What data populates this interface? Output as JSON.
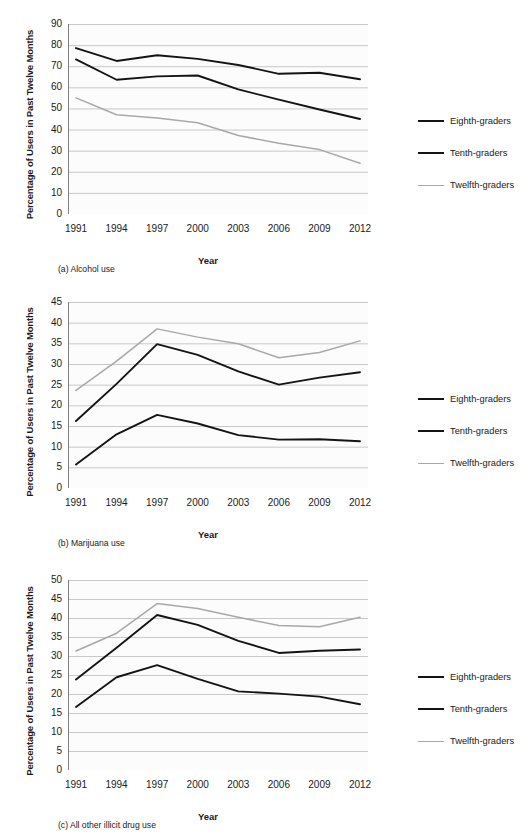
{
  "figure": {
    "series_names": [
      "Eighth-graders",
      "Tenth-graders",
      "Twelfth-graders"
    ],
    "axis_titles": {
      "y": "Percentage of Users in Past Twelve Months",
      "x": "Year"
    },
    "colors": {
      "eighth": "#141414",
      "tenth": "#141414",
      "twelfth": "#a8a8a8",
      "gridline": "#c8c8c8",
      "axis": "#7f7f7f",
      "text": "#1a1a1a",
      "background": "#ffffff"
    }
  },
  "panels": [
    {
      "id": "a",
      "caption": "(a) Alcohol use",
      "legend": [
        "Eighth-graders",
        "Tenth-graders",
        "Twelfth-graders"
      ],
      "yticks": [
        "0",
        "10",
        "20",
        "30",
        "40",
        "50",
        "60",
        "70",
        "80",
        "90"
      ],
      "xticks": [
        "1991",
        "1994",
        "1997",
        "2000",
        "2003",
        "2006",
        "2009",
        "2012"
      ]
    },
    {
      "id": "b",
      "caption": "(b) Marijuana use",
      "legend": [
        "Eighth-graders",
        "Tenth-graders",
        "Twelfth-graders"
      ],
      "yticks": [
        "0",
        "5",
        "10",
        "15",
        "20",
        "25",
        "30",
        "35",
        "40",
        "45"
      ],
      "xticks": [
        "1991",
        "1994",
        "1997",
        "2000",
        "2003",
        "2006",
        "2009",
        "2012"
      ]
    },
    {
      "id": "c",
      "caption": "(c) All other illicit drug use",
      "legend": [
        "Eighth-graders",
        "Tenth-graders",
        "Twelfth-graders"
      ],
      "yticks": [
        "0",
        "5",
        "10",
        "15",
        "20",
        "25",
        "30",
        "35",
        "40",
        "45",
        "50"
      ],
      "xticks": [
        "1991",
        "1994",
        "1997",
        "2000",
        "2003",
        "2006",
        "2009",
        "2012"
      ]
    }
  ],
  "chart_data": [
    {
      "type": "line",
      "title": "(a) Alcohol use",
      "xlabel": "Year",
      "ylabel": "Percentage of Users in Past Twelve Months",
      "categories": [
        1991,
        1994,
        1997,
        2000,
        2003,
        2006,
        2009,
        2012
      ],
      "ylim": [
        0,
        90
      ],
      "ytick_step": 10,
      "grid": true,
      "legend_position": "right",
      "series": [
        {
          "name": "Eighth-graders",
          "color": "#141414",
          "values": [
            73.2,
            63.6,
            65.2,
            65.6,
            59.0,
            54.2,
            49.5,
            45.0
          ]
        },
        {
          "name": "Tenth-graders",
          "color": "#141414",
          "values": [
            78.6,
            72.5,
            75.2,
            73.5,
            70.6,
            66.4,
            66.9,
            63.8
          ]
        },
        {
          "name": "Twelfth-graders",
          "color": "#a8a8a8",
          "values": [
            55.0,
            47.0,
            45.5,
            43.2,
            37.2,
            33.5,
            30.5,
            24.0
          ]
        }
      ],
      "series_note": "Eighth-graders plotted lowest of the two dark lines; values read from gridlines"
    },
    {
      "type": "line",
      "title": "(b) Marijuana use",
      "xlabel": "Year",
      "ylabel": "Percentage of Users in Past Twelve Months",
      "categories": [
        1991,
        1994,
        1997,
        2000,
        2003,
        2006,
        2009,
        2012
      ],
      "ylim": [
        0,
        45
      ],
      "ytick_step": 5,
      "grid": true,
      "legend_position": "right",
      "series": [
        {
          "name": "Eighth-graders",
          "color": "#141414",
          "values": [
            5.7,
            13.0,
            17.7,
            15.6,
            12.8,
            11.7,
            11.8,
            11.3
          ]
        },
        {
          "name": "Tenth-graders",
          "color": "#141414",
          "values": [
            16.2,
            25.2,
            34.8,
            32.2,
            28.2,
            25.0,
            26.7,
            28.0
          ]
        },
        {
          "name": "Twelfth-graders",
          "color": "#a8a8a8",
          "values": [
            23.6,
            30.7,
            38.5,
            36.5,
            34.9,
            31.5,
            32.8,
            35.6
          ]
        }
      ]
    },
    {
      "type": "line",
      "title": "(c) All other illicit drug use",
      "xlabel": "Year",
      "ylabel": "Percentage of Users in Past Twelve Months",
      "categories": [
        1991,
        1994,
        1997,
        2000,
        2003,
        2006,
        2009,
        2012
      ],
      "ylim": [
        0,
        50
      ],
      "ytick_step": 5,
      "grid": true,
      "legend_position": "right",
      "series": [
        {
          "name": "Eighth-graders",
          "color": "#141414",
          "values": [
            16.6,
            24.4,
            27.6,
            24.0,
            20.7,
            20.1,
            19.3,
            17.3
          ]
        },
        {
          "name": "Tenth-graders",
          "color": "#141414",
          "values": [
            23.8,
            32.2,
            40.8,
            38.2,
            34.0,
            30.8,
            31.4,
            31.7
          ]
        },
        {
          "name": "Twelfth-graders",
          "color": "#a8a8a8",
          "values": [
            31.3,
            36.0,
            43.8,
            42.5,
            40.2,
            38.0,
            37.7,
            40.2
          ]
        }
      ]
    }
  ]
}
